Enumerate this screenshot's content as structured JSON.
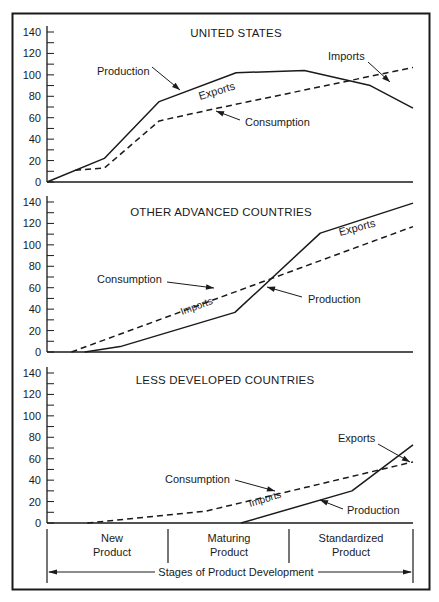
{
  "chart_data": [
    {
      "type": "line",
      "title": "UNITED STATES",
      "xlabel": "Stages of Product Development",
      "ylabel": "",
      "ylim": [
        0,
        140
      ],
      "yticks": [
        0,
        20,
        40,
        60,
        80,
        100,
        120,
        140
      ],
      "x_stages": [
        "New Product",
        "Maturing Product",
        "Standardized Product"
      ],
      "grid": false,
      "series": [
        {
          "name": "Production",
          "style": "solid",
          "x": [
            0,
            0.47,
            0.92,
            1.55,
            2.11,
            2.65,
            3.0
          ],
          "y": [
            0,
            22,
            75,
            102,
            104,
            90,
            69
          ]
        },
        {
          "name": "Consumption",
          "style": "dashed",
          "x": [
            0.23,
            0.47,
            0.92,
            1.4,
            3.0
          ],
          "y": [
            11,
            13,
            57,
            69,
            107
          ]
        }
      ],
      "annotations": [
        {
          "text": "Production",
          "x": 97,
          "y": 75,
          "arrow": [
            152,
            67,
            180,
            90
          ]
        },
        {
          "text": "Exports",
          "x": 200,
          "y": 100,
          "rotate": -17,
          "small": false
        },
        {
          "text": "Consumption",
          "x": 245,
          "y": 126,
          "arrow": [
            240,
            120,
            216,
            111
          ]
        },
        {
          "text": "Imports",
          "x": 328,
          "y": 60,
          "arrow": [
            368,
            62,
            390,
            82
          ]
        }
      ]
    },
    {
      "type": "line",
      "title": "OTHER ADVANCED COUNTRIES",
      "xlabel": "Stages of Product Development",
      "ylabel": "",
      "ylim": [
        0,
        140
      ],
      "yticks": [
        0,
        20,
        40,
        60,
        80,
        100,
        120,
        140
      ],
      "x_stages": [
        "New Product",
        "Maturing Product",
        "Standardized Product"
      ],
      "grid": false,
      "series": [
        {
          "name": "Production",
          "style": "solid",
          "x": [
            0.31,
            0.6,
            1.54,
            2.24,
            3.0
          ],
          "y": [
            0,
            5,
            37,
            111,
            139
          ]
        },
        {
          "name": "Consumption",
          "style": "dashed",
          "x": [
            0.2,
            3.0
          ],
          "y": [
            0,
            117
          ]
        }
      ],
      "annotations": [
        {
          "text": "Consumption",
          "x": 97,
          "y": 283,
          "arrow": [
            167,
            282,
            214,
            288
          ]
        },
        {
          "text": "Imports",
          "x": 182,
          "y": 315,
          "rotate": -20,
          "small": true
        },
        {
          "text": "Production",
          "x": 308,
          "y": 303,
          "arrow": [
            302,
            297,
            267,
            287
          ]
        },
        {
          "text": "Exports",
          "x": 340,
          "y": 236,
          "rotate": -15,
          "small": false
        }
      ]
    },
    {
      "type": "line",
      "title": "LESS DEVELOPED COUNTRIES",
      "xlabel": "Stages of Product Development",
      "ylabel": "",
      "ylim": [
        0,
        140
      ],
      "yticks": [
        0,
        20,
        40,
        60,
        80,
        100,
        120,
        140
      ],
      "x_stages": [
        "New Product",
        "Maturing Product",
        "Standardized Product"
      ],
      "grid": false,
      "series": [
        {
          "name": "Production",
          "style": "solid",
          "x": [
            1.59,
            2.5,
            3.0
          ],
          "y": [
            0,
            30,
            73
          ]
        },
        {
          "name": "Consumption",
          "style": "dashed",
          "x": [
            0.33,
            1.3,
            3.0
          ],
          "y": [
            0,
            11,
            57
          ]
        }
      ],
      "annotations": [
        {
          "text": "Consumption",
          "x": 165,
          "y": 483,
          "arrow": [
            235,
            480,
            275,
            491
          ]
        },
        {
          "text": "Imports",
          "x": 250,
          "y": 507,
          "rotate": -17,
          "small": true
        },
        {
          "text": "Production",
          "x": 347,
          "y": 514,
          "arrow": [
            343,
            509,
            320,
            500
          ]
        },
        {
          "text": "Exports",
          "x": 338,
          "y": 442,
          "arrow": [
            378,
            444,
            410,
            462
          ]
        }
      ]
    }
  ],
  "figure": {
    "x_axis_title": "Stages of Product Development",
    "stages": [
      {
        "line1": "New",
        "line2": "Product"
      },
      {
        "line1": "Maturing",
        "line2": "Product"
      },
      {
        "line1": "Standardized",
        "line2": "Product"
      }
    ],
    "ink_color": "#1a1a1a",
    "background": "#ffffff"
  }
}
